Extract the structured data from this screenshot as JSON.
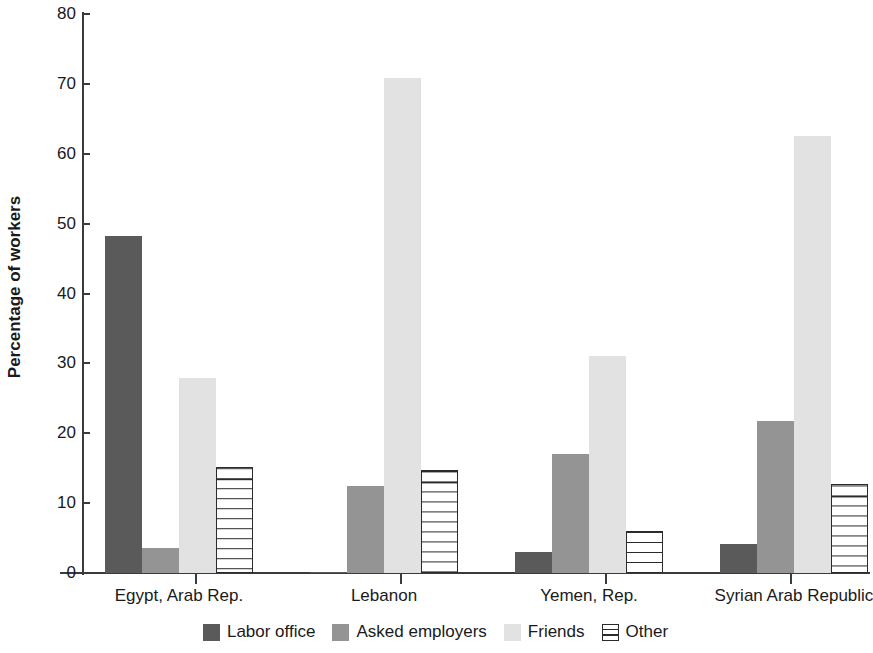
{
  "chart_data": {
    "type": "bar",
    "title": "",
    "subtitle": "",
    "xlabel": "",
    "ylabel": "Percentage of workers",
    "ylim": [
      0,
      80
    ],
    "yticks": [
      0,
      10,
      20,
      30,
      40,
      50,
      60,
      70,
      80
    ],
    "grid": false,
    "legend_position": "bottom",
    "categories": [
      "Egypt, Arab Rep.",
      "Lebanon",
      "Yemen, Rep.",
      "Syrian Arab Republic"
    ],
    "series": [
      {
        "name": "Labor office",
        "color": "#5a5a5a",
        "values": [
          48.3,
          0.2,
          3.0,
          4.1
        ]
      },
      {
        "name": "Asked employers",
        "color": "#949494",
        "values": [
          3.6,
          12.5,
          17.0,
          21.8
        ]
      },
      {
        "name": "Friends",
        "color": "#e2e2e2",
        "values": [
          27.9,
          70.9,
          31.0,
          62.5
        ]
      },
      {
        "name": "Other",
        "color": "#ffffff",
        "values": [
          15.2,
          14.8,
          6.0,
          12.8
        ]
      }
    ]
  },
  "axis": {
    "y_label": "Percentage of workers",
    "y_tick_labels": [
      "0",
      "10",
      "20",
      "30",
      "40",
      "50",
      "60",
      "70",
      "80"
    ]
  },
  "legend": {
    "items": [
      {
        "label": "Labor office"
      },
      {
        "label": "Asked employers"
      },
      {
        "label": "Friends"
      },
      {
        "label": "Other"
      }
    ]
  }
}
